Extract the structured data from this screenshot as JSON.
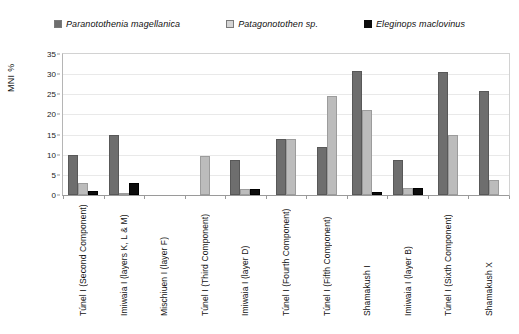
{
  "chart_data": {
    "type": "bar",
    "title": "",
    "xlabel": "",
    "ylabel": "MNI %",
    "ylim": [
      0,
      35
    ],
    "yticks": [
      0,
      5,
      10,
      15,
      20,
      25,
      30,
      35
    ],
    "grid": true,
    "legend_position": "top-center",
    "categories": [
      "Túnel I (Second Component)",
      "Imiwaia I (layers K, L & M)",
      "Mischiuen I (layer F)",
      "Túnel I (Third Component)",
      "Imiwaia I (layer D)",
      "Túnel I (Fourth Component)",
      "Túnel I (Fifth Component)",
      "Shamakush I",
      "Imiwaia I (layer B)",
      "Túnel I (Sixth Component)",
      "Shamakush X"
    ],
    "series": [
      {
        "name": "Paranotothenia magellanica",
        "color": "#6e6e6e",
        "values": [
          10,
          15,
          0,
          0,
          8.7,
          13.8,
          12,
          30.8,
          8.6,
          30.5,
          25.8
        ]
      },
      {
        "name": "Patagonotothen sp.",
        "color": "#bcbcbc",
        "values": [
          3,
          0.6,
          0,
          9.8,
          1.6,
          13.8,
          24.6,
          21,
          1.7,
          14.8,
          3.8
        ]
      },
      {
        "name": "Eleginops maclovinus",
        "color": "#0d0d0d",
        "values": [
          1,
          3,
          0,
          0,
          1.6,
          0,
          0,
          0.8,
          1.7,
          0,
          0
        ]
      }
    ]
  },
  "legend": {
    "items": [
      {
        "label": "Paranotothenia magellanica",
        "swatch": "legend-swatch-dark-gray",
        "color": "#6e6e6e"
      },
      {
        "label": "Patagonotothen sp.",
        "swatch": "legend-swatch-light-gray",
        "color": "#bcbcbc"
      },
      {
        "label": "Eleginops maclovinus",
        "swatch": "legend-swatch-black",
        "color": "#0d0d0d"
      }
    ]
  },
  "axes": {
    "y_title": "MNI %",
    "y_tick_labels": [
      "35",
      "30",
      "25",
      "20",
      "15",
      "10",
      "5",
      "0"
    ]
  }
}
